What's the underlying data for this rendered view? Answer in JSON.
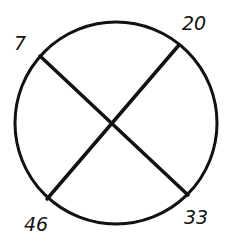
{
  "diagram": {
    "type": "circle-with-crossing-chords",
    "stroke_color": "#111111",
    "background": "#ffffff",
    "circle": {
      "cx": 116,
      "cy": 123,
      "r": 101
    },
    "chords": [
      {
        "from": "7",
        "to": "33",
        "x1": 40,
        "y1": 56,
        "x2": 188,
        "y2": 195
      },
      {
        "from": "20",
        "to": "46",
        "x1": 179,
        "y1": 45,
        "x2": 47,
        "y2": 199
      }
    ],
    "labels": [
      {
        "text": "7",
        "x": 14,
        "y": 50
      },
      {
        "text": "20",
        "x": 182,
        "y": 30
      },
      {
        "text": "46",
        "x": 24,
        "y": 231
      },
      {
        "text": "33",
        "x": 184,
        "y": 224
      }
    ]
  }
}
